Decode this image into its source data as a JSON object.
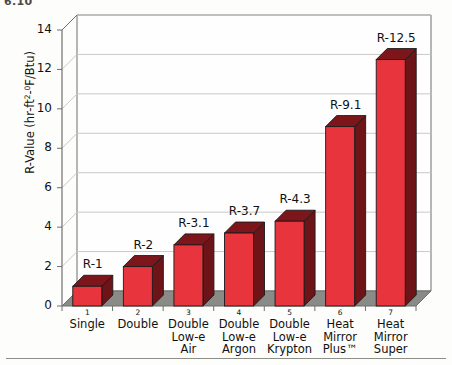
{
  "page_number": "6.10",
  "chart_data": {
    "type": "bar",
    "title": "",
    "xlabel": "",
    "ylabel": "R-Value (hr-ft2-0F/Btu)",
    "ylabel_parts": {
      "prefix": "R-Value (hr-ft",
      "sup1": "2",
      "mid": "-",
      "sup2": "0",
      "suffix": "F/Btu)"
    },
    "ylim": [
      0,
      14
    ],
    "ytick_labels": [
      "0",
      "2",
      "4",
      "6",
      "8",
      "10",
      "12",
      "14"
    ],
    "ytick_values": [
      0,
      2,
      4,
      6,
      8,
      10,
      12,
      14
    ],
    "grid": true,
    "legend": "none",
    "style": "3d-column",
    "index_labels": [
      "1",
      "2",
      "3",
      "4",
      "5",
      "6",
      "7"
    ],
    "categories": [
      "Single",
      "Double",
      "Double Low-e Air",
      "Double Low-e Argon",
      "Double Low-e Krypton",
      "Heat Mirror Plus™",
      "Heat Mirror Super"
    ],
    "category_lines": [
      [
        "Single"
      ],
      [
        "Double"
      ],
      [
        "Double",
        "Low-e",
        "Air"
      ],
      [
        "Double",
        "Low-e",
        "Argon"
      ],
      [
        "Double",
        "Low-e",
        "Krypton"
      ],
      [
        "Heat",
        "Mirror",
        "Plus™"
      ],
      [
        "Heat",
        "Mirror",
        "Super"
      ]
    ],
    "values": [
      1,
      2,
      3.1,
      3.7,
      4.3,
      9.1,
      12.5
    ],
    "data_labels": [
      "R-1",
      "R-2",
      "R-3.1",
      "R-3.7",
      "R-4.3",
      "R-9.1",
      "R-12.5"
    ],
    "colors": {
      "bar_front": "#e8343c",
      "bar_side": "#6d1418",
      "bar_top": "#7d161b",
      "bar_outline": "#1a1a1a",
      "floor": "#8a8a86",
      "grid": "#c9c9c9",
      "axis": "#6f6f6f",
      "background": "#fdfdfb"
    }
  }
}
